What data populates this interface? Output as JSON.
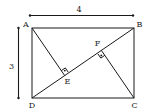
{
  "diagram": {
    "type": "geometry",
    "shape": "rectangle ABCD with diagonal DB and perpendiculars AE and CF",
    "colors": {
      "stroke": "#1a1a1a",
      "text": "#222222",
      "background": "#ffffff"
    },
    "dimensions": {
      "width_label": "4",
      "height_label": "3"
    },
    "vertices": {
      "A": {
        "label": "A",
        "x": 32,
        "y": 28
      },
      "B": {
        "label": "B",
        "x": 134,
        "y": 28
      },
      "C": {
        "label": "C",
        "x": 134,
        "y": 98
      },
      "D": {
        "label": "D",
        "x": 32,
        "y": 98
      },
      "E": {
        "label": "E",
        "x": 64.7,
        "y": 75.6
      },
      "F": {
        "label": "F",
        "x": 101.4,
        "y": 50.4
      }
    },
    "segments": [
      {
        "from": "A",
        "to": "B"
      },
      {
        "from": "B",
        "to": "C"
      },
      {
        "from": "C",
        "to": "D"
      },
      {
        "from": "D",
        "to": "A"
      },
      {
        "from": "D",
        "to": "B"
      },
      {
        "from": "A",
        "to": "E"
      },
      {
        "from": "C",
        "to": "F"
      }
    ],
    "right_angle_marks": [
      "E",
      "F"
    ]
  }
}
